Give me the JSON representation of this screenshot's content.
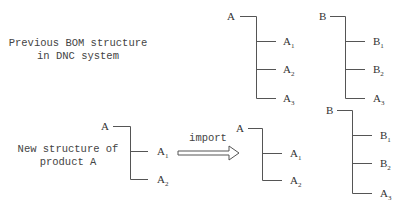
{
  "diagram": {
    "type": "BOM structure import diagram",
    "labels": {
      "previous": [
        "Previous BOM structure",
        "in DNC system"
      ],
      "new": [
        "New structure of",
        "product A"
      ],
      "arrow": "import"
    },
    "trees": [
      {
        "id": "previous-A",
        "root": "A",
        "children": [
          {
            "base": "A",
            "sub": "1"
          },
          {
            "base": "A",
            "sub": "2"
          },
          {
            "base": "A",
            "sub": "3"
          }
        ]
      },
      {
        "id": "previous-B",
        "root": "B",
        "children": [
          {
            "base": "B",
            "sub": "1"
          },
          {
            "base": "B",
            "sub": "2"
          },
          {
            "base": "A",
            "sub": "3"
          }
        ]
      },
      {
        "id": "new-A",
        "root": "A",
        "children": [
          {
            "base": "A",
            "sub": "1"
          },
          {
            "base": "A",
            "sub": "2"
          }
        ]
      },
      {
        "id": "imported-A",
        "root": "A",
        "children": [
          {
            "base": "A",
            "sub": "1"
          },
          {
            "base": "A",
            "sub": "2"
          }
        ]
      },
      {
        "id": "imported-B",
        "root": "B",
        "children": [
          {
            "base": "B",
            "sub": "1"
          },
          {
            "base": "B",
            "sub": "2"
          },
          {
            "base": "A",
            "sub": "3"
          }
        ]
      }
    ]
  }
}
